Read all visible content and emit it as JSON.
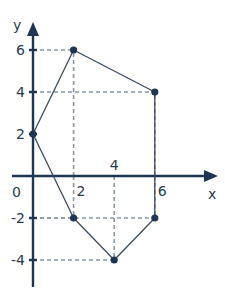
{
  "diagram": {
    "type": "coordinate-polygon",
    "axes": {
      "x_label": "x",
      "y_label": "y",
      "origin_label": "0",
      "x_ticks": [
        {
          "value": 2,
          "label": "2"
        },
        {
          "value": 4,
          "label": "4"
        },
        {
          "value": 6,
          "label": "6"
        }
      ],
      "y_ticks": [
        {
          "value": 6,
          "label": "6"
        },
        {
          "value": 4,
          "label": "4"
        },
        {
          "value": 2,
          "label": "2"
        },
        {
          "value": -2,
          "label": "-2"
        },
        {
          "value": -4,
          "label": "-4"
        }
      ]
    },
    "vertices": [
      {
        "x": 0,
        "y": 2
      },
      {
        "x": 2,
        "y": 6
      },
      {
        "x": 6,
        "y": 4
      },
      {
        "x": 6,
        "y": -2
      },
      {
        "x": 4,
        "y": -4
      },
      {
        "x": 2,
        "y": -2
      }
    ],
    "colors": {
      "axis": "#1f3552",
      "guide": "#8a97a8",
      "edge": "#3a4a5e",
      "vertex": "#1f3552",
      "label": "#2a3a50"
    }
  }
}
